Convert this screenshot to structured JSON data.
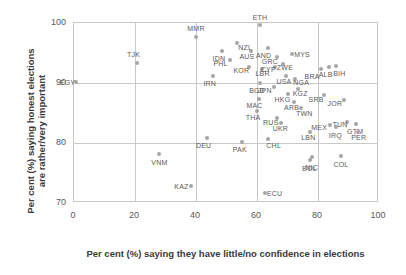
{
  "chart_data": {
    "type": "scatter",
    "title": "",
    "xlabel": "Per cent (%) saying they have little/no confidence in elections",
    "ylabel": "Per cent (%) saying honest elections are rather/very important",
    "xlim": [
      0,
      100
    ],
    "ylim": [
      70,
      100
    ],
    "xticks": [
      "0",
      "20",
      "40",
      "60",
      "80",
      "100"
    ],
    "yticks": [
      "70",
      "80",
      "90",
      "100"
    ],
    "xtick_values": [
      0,
      20,
      40,
      60,
      80,
      100
    ],
    "ytick_values": [
      70,
      80,
      90,
      100
    ],
    "grid": true,
    "legend": "none",
    "marker_color": "#a6a6a6",
    "label_color": "#595959",
    "points": [
      {
        "label": "EGY",
        "x": 0.5,
        "y": 90.2,
        "lx": -8,
        "ly": 0
      },
      {
        "label": "TJK",
        "x": 20.5,
        "y": 93.3,
        "lx": -3,
        "ly": -9
      },
      {
        "label": "MMR",
        "x": 40.0,
        "y": 97.6,
        "lx": 0,
        "ly": -9
      },
      {
        "label": "ETH",
        "x": 61.0,
        "y": 99.6,
        "lx": 0,
        "ly": -8
      },
      {
        "label": "NZL",
        "x": 53.5,
        "y": 96.6,
        "lx": 8,
        "ly": 4
      },
      {
        "label": "IDN",
        "x": 48.5,
        "y": 95.4,
        "lx": -3,
        "ly": 7
      },
      {
        "label": "AUS",
        "x": 58.0,
        "y": 95.3,
        "lx": -4,
        "ly": 5
      },
      {
        "label": "PHL",
        "x": 51.0,
        "y": 93.9,
        "lx": -9,
        "ly": 3
      },
      {
        "label": "KOR",
        "x": 57.5,
        "y": 92.6,
        "lx": -8,
        "ly": 3
      },
      {
        "label": "LBR",
        "x": 61.5,
        "y": 92.3,
        "lx": 1,
        "ly": 4
      },
      {
        "label": "IRN",
        "x": 45.5,
        "y": 91.2,
        "lx": -3,
        "ly": 7
      },
      {
        "label": "AND",
        "x": 63.5,
        "y": 95.8,
        "lx": -4,
        "ly": 7
      },
      {
        "label": "GRC",
        "x": 66.5,
        "y": 94.4,
        "lx": -7,
        "ly": 4
      },
      {
        "label": "MYS",
        "x": 71.5,
        "y": 94.9,
        "lx": 10,
        "ly": 0
      },
      {
        "label": "CYP",
        "x": 66.0,
        "y": 92.7,
        "lx": -7,
        "ly": 2
      },
      {
        "label": "ZWE",
        "x": 68.5,
        "y": 93.2,
        "lx": 2,
        "ly": 3
      },
      {
        "label": "USA",
        "x": 69.5,
        "y": 91.2,
        "lx": -2,
        "ly": 5
      },
      {
        "label": "NGA",
        "x": 72.5,
        "y": 90.6,
        "lx": 6,
        "ly": 3
      },
      {
        "label": "BGD",
        "x": 61.0,
        "y": 90.0,
        "lx": -3,
        "ly": 7
      },
      {
        "label": "JPN",
        "x": 65.5,
        "y": 89.4,
        "lx": -9,
        "ly": 3
      },
      {
        "label": "HKG",
        "x": 70.0,
        "y": 88.1,
        "lx": -5,
        "ly": 5
      },
      {
        "label": "KGZ",
        "x": 73.5,
        "y": 89.0,
        "lx": 2,
        "ly": 4
      },
      {
        "label": "ARB",
        "x": 72.0,
        "y": 86.8,
        "lx": -2,
        "ly": 5
      },
      {
        "label": "TWN",
        "x": 74.5,
        "y": 85.8,
        "lx": 3,
        "ly": 5
      },
      {
        "label": "MAC",
        "x": 60.5,
        "y": 87.4,
        "lx": -4,
        "ly": 6
      },
      {
        "label": "THA",
        "x": 60.0,
        "y": 85.4,
        "lx": -4,
        "ly": 6
      },
      {
        "label": "RUS",
        "x": 66.5,
        "y": 84.2,
        "lx": -6,
        "ly": 4
      },
      {
        "label": "UKR",
        "x": 68.0,
        "y": 83.3,
        "lx": -1,
        "ly": 5
      },
      {
        "label": "BRA",
        "x": 81.0,
        "y": 92.4,
        "lx": -9,
        "ly": 7
      },
      {
        "label": "ALB",
        "x": 83.5,
        "y": 92.7,
        "lx": -3,
        "ly": 7
      },
      {
        "label": "BIH",
        "x": 86.0,
        "y": 92.8,
        "lx": 3,
        "ly": 7
      },
      {
        "label": "SRB",
        "x": 82.0,
        "y": 88.0,
        "lx": -8,
        "ly": 4
      },
      {
        "label": "JOR",
        "x": 88.5,
        "y": 87.1,
        "lx": -9,
        "ly": 3
      },
      {
        "label": "TUN",
        "x": 89.5,
        "y": 83.5,
        "lx": -7,
        "ly": 2
      },
      {
        "label": "MEX",
        "x": 84.0,
        "y": 83.0,
        "lx": -11,
        "ly": 2
      },
      {
        "label": "IRQ",
        "x": 86.0,
        "y": 82.7,
        "lx": -1,
        "ly": 8
      },
      {
        "label": "GTM",
        "x": 92.5,
        "y": 83.2,
        "lx": -1,
        "ly": 7
      },
      {
        "label": "PER",
        "x": 93.0,
        "y": 81.8,
        "lx": 1,
        "ly": 5
      },
      {
        "label": "LBN",
        "x": 77.5,
        "y": 81.8,
        "lx": -2,
        "ly": 5
      },
      {
        "label": "DEU",
        "x": 43.5,
        "y": 80.8,
        "lx": -3,
        "ly": 7
      },
      {
        "label": "PAK",
        "x": 55.0,
        "y": 80.1,
        "lx": -2,
        "ly": 7
      },
      {
        "label": "CHL",
        "x": 63.5,
        "y": 80.6,
        "lx": 6,
        "ly": 6
      },
      {
        "label": "VNM",
        "x": 28.0,
        "y": 78.1,
        "lx": 0,
        "ly": 8
      },
      {
        "label": "KAZ",
        "x": 38.5,
        "y": 72.9,
        "lx": -10,
        "ly": 0
      },
      {
        "label": "ECU",
        "x": 62.5,
        "y": 71.7,
        "lx": 10,
        "ly": 0
      },
      {
        "label": "BOL",
        "x": 77.5,
        "y": 77.2,
        "lx": -1,
        "ly": 8
      },
      {
        "label": "NIC",
        "x": 78.0,
        "y": 77.6,
        "lx": 0,
        "ly": 10
      },
      {
        "label": "COL",
        "x": 87.5,
        "y": 77.9,
        "lx": 0,
        "ly": 8
      }
    ]
  }
}
